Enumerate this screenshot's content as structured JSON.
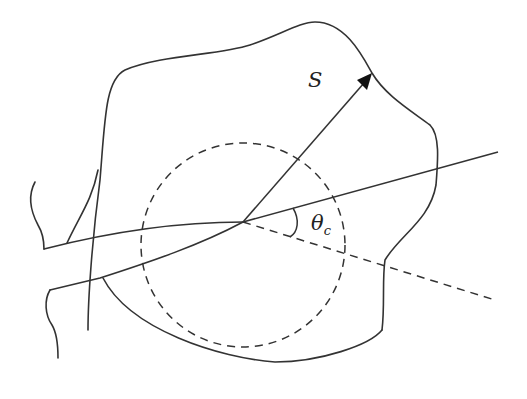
{
  "figure": {
    "type": "geometric diagram",
    "labels": {
      "vector": "S",
      "angle": "θ",
      "angle_subscript": "c"
    },
    "colors": {
      "stroke": "#333333",
      "background": "#ffffff"
    },
    "elements": [
      "irregular closed region boundary",
      "dashed circle centered at intersection point",
      "vector arrow S from center to boundary",
      "solid line through center",
      "dashed line extending from center",
      "angle arc theta_c between solid and dashed lines",
      "wedge/strip entering from left"
    ]
  }
}
